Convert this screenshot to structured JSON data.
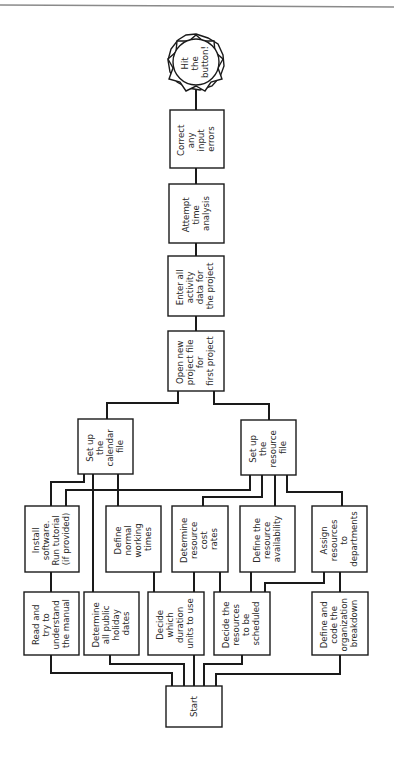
{
  "diagram": {
    "orientation": "rotated-90-ccw",
    "nodes": {
      "hit_button": {
        "lines": [
          "Hit",
          "the",
          "button!"
        ],
        "shape": "star-circle"
      },
      "correct": {
        "lines": [
          "Correct",
          "any",
          "input",
          "errors"
        ]
      },
      "attempt": {
        "lines": [
          "Attempt",
          "time",
          "analysis"
        ]
      },
      "enter": {
        "lines": [
          "Enter all",
          "activity",
          "data for",
          "the project"
        ]
      },
      "open": {
        "lines": [
          "Open new",
          "project file",
          "for",
          "first project"
        ]
      },
      "calendar": {
        "lines": [
          "Set up",
          "the",
          "calendar",
          "file"
        ]
      },
      "resource": {
        "lines": [
          "Set up",
          "the",
          "resource",
          "file"
        ]
      },
      "install": {
        "lines": [
          "Install",
          "software.",
          "Run tutorial",
          "(if provided)"
        ]
      },
      "define_working": {
        "lines": [
          "Define",
          "normal",
          "working",
          "times"
        ]
      },
      "determine_cost": {
        "lines": [
          "Determine",
          "resource",
          "cost",
          "rates"
        ]
      },
      "define_availability": {
        "lines": [
          "Define the",
          "resource",
          "availability"
        ]
      },
      "assign": {
        "lines": [
          "Assign",
          "resources",
          "to",
          "departments"
        ]
      },
      "read_manual": {
        "lines": [
          "Read and",
          "try to",
          "understand",
          "the manual"
        ]
      },
      "holiday": {
        "lines": [
          "Determine",
          "all public",
          "holiday",
          "dates"
        ]
      },
      "duration": {
        "lines": [
          "Decide",
          "which",
          "duration",
          "units to use"
        ]
      },
      "resources_scheduled": {
        "lines": [
          "Decide the",
          "resources",
          "to be",
          "scheduled"
        ]
      },
      "org_breakdown": {
        "lines": [
          "Define and",
          "code the",
          "organization",
          "breakdown"
        ]
      },
      "start": {
        "lines": [
          "Start"
        ]
      }
    }
  }
}
